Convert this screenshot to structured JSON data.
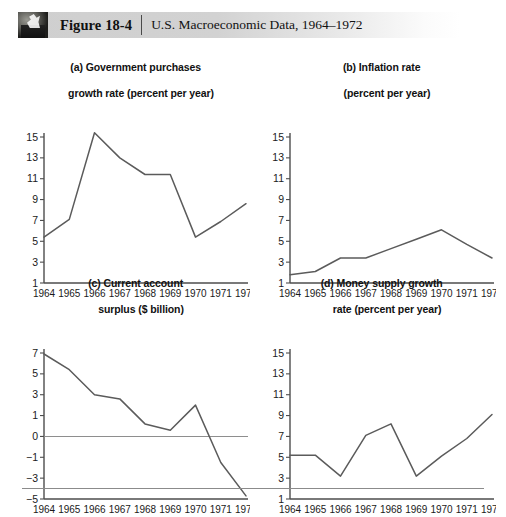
{
  "header": {
    "thumbnail_icon": "photo-thumbnail-icon",
    "figure_label": "Figure 18-4",
    "caption": "U.S. Macroeconomic Data, 1964–1972"
  },
  "chart_data": [
    {
      "id": "a",
      "type": "line",
      "title": "(a) Government purchases",
      "title_line2": "growth rate (percent per year)",
      "xlabel": "",
      "ylabel": "",
      "categories": [
        "1964",
        "1965",
        "1966",
        "1967",
        "1968",
        "1969",
        "1970",
        "1971",
        "1972"
      ],
      "values": [
        5.4,
        7.1,
        15.4,
        13.0,
        11.4,
        11.4,
        5.4,
        6.9,
        8.6
      ],
      "yticks": [
        15,
        13,
        11,
        9,
        7,
        5,
        3,
        1
      ],
      "ylim": [
        1,
        16
      ],
      "grid": false,
      "legend": "none"
    },
    {
      "id": "b",
      "type": "line",
      "title": "(b) Inflation rate",
      "title_line2": "(percent per year)",
      "xlabel": "",
      "ylabel": "",
      "categories": [
        "1964",
        "1965",
        "1966",
        "1967",
        "1968",
        "1969",
        "1970",
        "1971",
        "1972"
      ],
      "values": [
        1.8,
        2.1,
        3.4,
        3.4,
        4.3,
        5.2,
        6.1,
        4.7,
        3.4
      ],
      "yticks": [
        15,
        13,
        11,
        9,
        7,
        5,
        3,
        1
      ],
      "ylim": [
        1,
        16
      ],
      "grid": false,
      "legend": "none"
    },
    {
      "id": "c",
      "type": "line",
      "title": "(c) Current account",
      "title_line2": "surplus ($ billion)",
      "xlabel": "",
      "ylabel": "",
      "categories": [
        "1964",
        "1965",
        "1966",
        "1967",
        "1968",
        "1969",
        "1970",
        "1971",
        "1972"
      ],
      "values": [
        6.9,
        5.4,
        3.0,
        2.6,
        0.6,
        0.3,
        2.0,
        -1.5,
        -4.7
      ],
      "yticks": [
        7,
        5,
        3,
        1,
        0,
        -1,
        -3,
        -5
      ],
      "ylim": [
        -5,
        7.6
      ],
      "zero_line": 0,
      "grid": false,
      "legend": "none"
    },
    {
      "id": "d",
      "type": "line",
      "title": "(d) Money supply growth",
      "title_line2": "rate (percent per year)",
      "xlabel": "",
      "ylabel": "",
      "categories": [
        "1964",
        "1965",
        "1966",
        "1967",
        "1968",
        "1969",
        "1970",
        "1971",
        "1972"
      ],
      "values": [
        5.2,
        5.2,
        3.2,
        7.1,
        8.2,
        3.2,
        5.1,
        6.8,
        9.1
      ],
      "yticks": [
        15,
        13,
        11,
        9,
        7,
        5,
        3,
        1
      ],
      "ylim": [
        1,
        16
      ],
      "grid": false,
      "legend": "none"
    }
  ],
  "colors": {
    "line": "#5b5b5b",
    "axis": "#4d4d4d",
    "zero_line": "#8e8e8e",
    "header_band": "#d2d2d2",
    "text": "#111111"
  }
}
